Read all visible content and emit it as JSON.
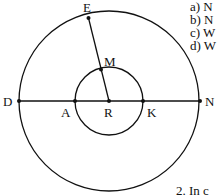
{
  "diagram": {
    "outer_circle": {
      "center": "R",
      "points_on": [
        "D",
        "E",
        "N"
      ]
    },
    "inner_circle": {
      "center": "R",
      "points_on": [
        "A",
        "M",
        "K"
      ]
    },
    "segments": [
      "DN",
      "RE"
    ],
    "labels": {
      "E": "E",
      "M": "M",
      "D": "D",
      "A": "A",
      "R": "R",
      "K": "K",
      "N": "N"
    }
  },
  "questions": {
    "a": "a) N",
    "b": "b) N",
    "c": "c) W",
    "d": "d) W"
  },
  "footer_text": "2. In c"
}
